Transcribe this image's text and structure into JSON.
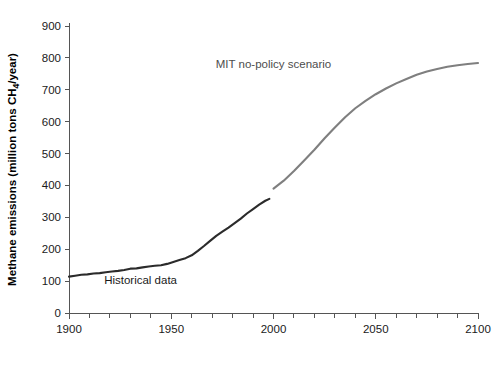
{
  "chart_data": {
    "type": "line",
    "title": "",
    "xlabel": "",
    "ylabel": "Methane emissions (million tons CH4/year)",
    "ylabel_display": "Methane emissions (million tons CH",
    "ylabel_sub": "4",
    "ylabel_tail": "/year)",
    "xlim": [
      1900,
      2100
    ],
    "ylim": [
      0,
      900
    ],
    "x_major_ticks": [
      1900,
      1950,
      2000,
      2050,
      2100
    ],
    "x_major_tick_labels": [
      "1900",
      "1950",
      "2000",
      "2050",
      "2100"
    ],
    "x_minor_tick_step": 10,
    "y_ticks": [
      0,
      100,
      200,
      300,
      400,
      500,
      600,
      700,
      800,
      900
    ],
    "y_tick_labels": [
      "0",
      "100",
      "200",
      "300",
      "400",
      "500",
      "600",
      "700",
      "800",
      "900"
    ],
    "grid": false,
    "legend_position": "inline-annotations",
    "series": [
      {
        "name": "Historical data",
        "color": "#2b2b2b",
        "line_width": 2.1,
        "label_text": "Historical data",
        "label_x": 1935,
        "label_y": 92,
        "label_color": "#1a1a1a",
        "x": [
          1900,
          1903,
          1906,
          1909,
          1912,
          1915,
          1918,
          1921,
          1924,
          1927,
          1930,
          1933,
          1936,
          1939,
          1942,
          1945,
          1948,
          1951,
          1954,
          1957,
          1960,
          1963,
          1966,
          1969,
          1972,
          1975,
          1978,
          1981,
          1984,
          1987,
          1990,
          1993,
          1996,
          1998
        ],
        "values": [
          114,
          117,
          120,
          121,
          124,
          125,
          128,
          130,
          132,
          135,
          139,
          140,
          143,
          146,
          148,
          150,
          154,
          160,
          166,
          172,
          181,
          195,
          210,
          226,
          242,
          255,
          268,
          282,
          296,
          312,
          326,
          340,
          352,
          358
        ]
      },
      {
        "name": "MIT no-policy scenario",
        "color": "#7f7f7f",
        "line_width": 2.1,
        "label_text": "MIT no-policy scenario",
        "label_x": 2000,
        "label_y": 768,
        "label_color": "#4d4d4d",
        "x": [
          2000,
          2005,
          2010,
          2015,
          2020,
          2025,
          2030,
          2035,
          2040,
          2045,
          2050,
          2055,
          2060,
          2065,
          2070,
          2075,
          2080,
          2085,
          2090,
          2095,
          2100
        ],
        "values": [
          390,
          415,
          445,
          478,
          512,
          548,
          582,
          614,
          642,
          665,
          686,
          704,
          720,
          734,
          747,
          757,
          765,
          772,
          777,
          781,
          784
        ]
      }
    ]
  },
  "geometry": {
    "plot_left": 69,
    "plot_right": 478,
    "plot_top": 26,
    "plot_bottom": 313
  }
}
